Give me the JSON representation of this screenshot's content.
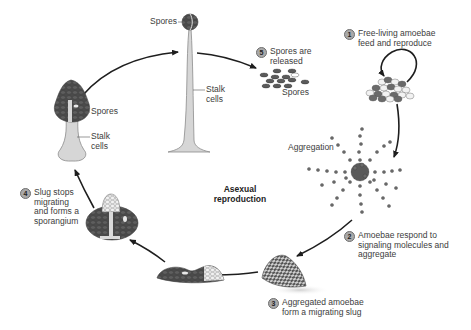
{
  "title": "Asexual reproduction",
  "cycle_label": [
    "Asexual",
    "reproduction"
  ],
  "steps": [
    {
      "number": "1",
      "lines": [
        "Free-living amoebae",
        "feed and reproduce"
      ]
    },
    {
      "number": "2",
      "lines": [
        "Amoebae respond to",
        "signaling molecules and",
        "aggregate"
      ]
    },
    {
      "number": "3",
      "lines": [
        "Aggregated amoebae",
        "form a migrating slug"
      ]
    },
    {
      "number": "4",
      "lines": [
        "Slug stops",
        "migrating",
        "and forms a",
        "sporangium"
      ]
    },
    {
      "number": "5",
      "lines": [
        "Spores are",
        "released"
      ]
    }
  ],
  "labels": {
    "tall_spores": "Spores",
    "tall_stalk": [
      "Stalk",
      "cells"
    ],
    "small_spores": "Spores",
    "small_stalk": [
      "Stalk",
      "cells"
    ],
    "released_spores": "Spores",
    "aggregation": "Aggregation"
  },
  "colors": {
    "arrow": "#1e1e1e",
    "dark_cell": "#4a4a4a",
    "light_cell": "#d9d9d9",
    "stalk": "#d6d6d6",
    "number_badge": "#a9a9a9",
    "text": "#3c3c3c"
  }
}
